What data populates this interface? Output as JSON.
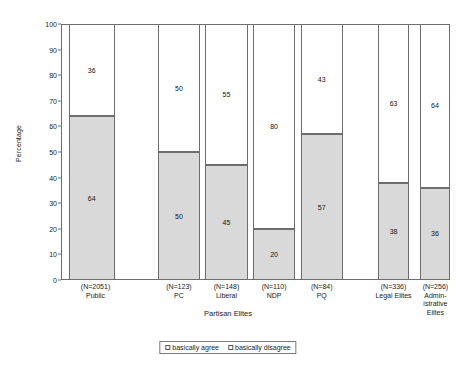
{
  "chart_data": {
    "type": "bar",
    "stacked": true,
    "title": "",
    "xlabel": "Partisan Elites",
    "ylabel": "Percentage",
    "ylim": [
      0,
      100
    ],
    "yticks": [
      0,
      10,
      20,
      30,
      40,
      50,
      60,
      70,
      80,
      90,
      100
    ],
    "grid": false,
    "legend_position": "bottom-center",
    "categories": [
      "Public",
      "PC",
      "Liberal",
      "NDP",
      "PQ",
      "Legal Elites",
      "Administrative Elites"
    ],
    "category_sample_sizes": [
      "(N=2051)",
      "(N=123)",
      "(N=148)",
      "(N=110)",
      "(N=84)",
      "(N=336)",
      "(N=256)"
    ],
    "series": [
      {
        "name": "basically agree",
        "color": "#d9d9d9",
        "values": [
          64,
          50,
          45,
          20,
          57,
          38,
          36
        ]
      },
      {
        "name": "basically disagree",
        "color": "#ffffff",
        "values": [
          36,
          50,
          55,
          80,
          43,
          63,
          64
        ]
      }
    ]
  },
  "axes": {
    "y_title": "Percentage",
    "x_title": "Partisan Elites",
    "y_tick_labels": [
      "100",
      "90",
      "80",
      "70",
      "60",
      "50",
      "40",
      "30",
      "20",
      "10",
      "0"
    ]
  },
  "bars": [
    {
      "key": "public",
      "name_lines": [
        "Public"
      ],
      "n_label": "(N=2051)",
      "agree": 64,
      "disagree": 36,
      "agree_label": "64",
      "disagree_label": "36",
      "left_pct": 2.0,
      "width_pct": 12.0,
      "label_left_pct": -2.0,
      "label_width_pct": 22.0
    },
    {
      "key": "pc",
      "name_lines": [
        "PC"
      ],
      "n_label": "(N=123)",
      "agree": 50,
      "disagree": 50,
      "agree_label": "50",
      "disagree_label": "50",
      "left_pct": 25.2,
      "width_pct": 11.0,
      "label_left_pct": 19.7,
      "label_width_pct": 22.0
    },
    {
      "key": "liberal",
      "name_lines": [
        "Liberal"
      ],
      "n_label": "(N=148)",
      "agree": 45,
      "disagree": 55,
      "agree_label": "45",
      "disagree_label": "55",
      "left_pct": 37.6,
      "width_pct": 11.0,
      "label_left_pct": 32.1,
      "label_width_pct": 22.0
    },
    {
      "key": "ndp",
      "name_lines": [
        "NDP"
      ],
      "n_label": "(N=110)",
      "agree": 20,
      "disagree": 80,
      "agree_label": "20",
      "disagree_label": "80",
      "left_pct": 50.0,
      "width_pct": 11.0,
      "label_left_pct": 44.5,
      "label_width_pct": 22.0
    },
    {
      "key": "pq",
      "name_lines": [
        "PQ"
      ],
      "n_label": "(N=84)",
      "agree": 57,
      "disagree": 43,
      "agree_label": "57",
      "disagree_label": "43",
      "left_pct": 62.4,
      "width_pct": 11.0,
      "label_left_pct": 56.9,
      "label_width_pct": 22.0
    },
    {
      "key": "legal-elites",
      "name_lines": [
        "Legal Elites"
      ],
      "n_label": "(N=336)",
      "agree": 38,
      "disagree": 63,
      "agree_label": "38",
      "disagree_label": "63",
      "left_pct": 82.6,
      "width_pct": 8.0,
      "label_left_pct": 75.6,
      "label_width_pct": 22.0
    },
    {
      "key": "administrative-elites",
      "name_lines": [
        "Admin-",
        "istrative",
        "Elites"
      ],
      "n_label": "(N=256)",
      "agree": 36,
      "disagree": 64,
      "agree_label": "36",
      "disagree_label": "64",
      "left_pct": 93.4,
      "width_pct": 8.0,
      "label_left_pct": 87.0,
      "label_width_pct": 21.0
    }
  ],
  "legend": {
    "items": [
      {
        "label": "basically agree",
        "swatch": "#ffffff"
      },
      {
        "label": "basically disagree",
        "swatch": "#ffffff"
      }
    ]
  }
}
